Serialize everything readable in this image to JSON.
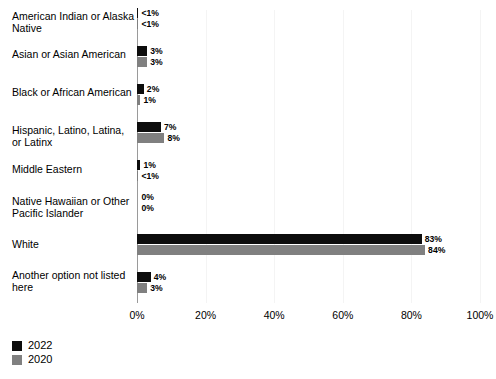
{
  "chart_data": {
    "type": "bar",
    "orientation": "horizontal",
    "title": "",
    "xlabel": "",
    "ylabel": "",
    "xlim": [
      0,
      100
    ],
    "xticks": [
      "0%",
      "20%",
      "40%",
      "60%",
      "80%",
      "100%"
    ],
    "grid": true,
    "legend_position": "bottom-left",
    "categories": [
      "American Indian or Alaska Native",
      "Asian or Asian American",
      "Black or African American",
      "Hispanic, Latino, Latina, or Latinx",
      "Middle Eastern",
      "Native Hawaiian or Other Pacific Islander",
      "White",
      "Another option not listed here"
    ],
    "series": [
      {
        "name": "2022",
        "color": "#0d0d0d",
        "values": [
          0.4,
          3,
          2,
          7,
          1,
          0,
          83,
          4
        ],
        "labels": [
          "<1%",
          "3%",
          "2%",
          "7%",
          "1%",
          "0%",
          "83%",
          "4%"
        ]
      },
      {
        "name": "2020",
        "color": "#808080",
        "values": [
          0.4,
          3,
          1,
          8,
          0.4,
          0,
          84,
          3
        ],
        "labels": [
          "<1%",
          "3%",
          "1%",
          "8%",
          "<1%",
          "0%",
          "84%",
          "3%"
        ]
      }
    ]
  },
  "legend": {
    "entries": [
      {
        "label": "2022",
        "color": "#0d0d0d"
      },
      {
        "label": "2020",
        "color": "#808080"
      }
    ]
  }
}
